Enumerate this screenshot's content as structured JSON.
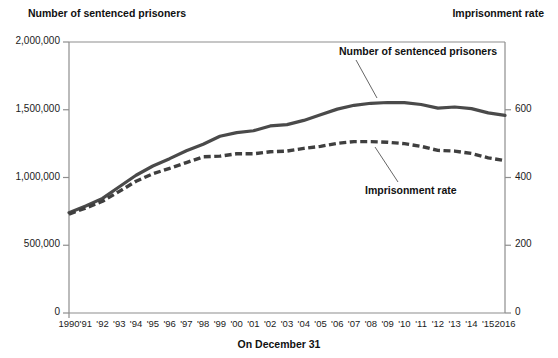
{
  "header": {
    "left_axis_title": "Number of sentenced prisoners",
    "right_axis_title": "Imprisonment rate"
  },
  "annotations": {
    "prisoners": "Number of sentenced prisoners",
    "rate": "Imprisonment rate"
  },
  "axis": {
    "xlabel": "On December 31",
    "y_left_ticks": [
      "0",
      "500,000",
      "1,000,000",
      "1,500,000",
      "2,000,000"
    ],
    "y_right_ticks": [
      "0",
      "200",
      "400",
      "600"
    ],
    "x_ticks": [
      "1990",
      "'91",
      "'92",
      "'93",
      "'94",
      "'95",
      "'96",
      "'97",
      "'98",
      "'99",
      "'00",
      "'01",
      "'02",
      "'03",
      "'04",
      "'05",
      "'06",
      "'07",
      "'08",
      "'09",
      "'10",
      "'11",
      "'12",
      "'13",
      "'14",
      "'15",
      "2016"
    ]
  },
  "colors": {
    "line": "#4a4a4a",
    "frame": "#8e8e8e",
    "text": "#1b1b1b"
  },
  "chart_data": {
    "type": "line",
    "title": "",
    "xlabel": "On December 31",
    "ylabel": "Number of sentenced prisoners",
    "y2label": "Imprisonment rate",
    "grid": false,
    "legend": "annotations-inline",
    "ylim": [
      0,
      2000000
    ],
    "y2lim": [
      0,
      800
    ],
    "x": [
      "1990",
      "1991",
      "1992",
      "1993",
      "1994",
      "1995",
      "1996",
      "1997",
      "1998",
      "1999",
      "2000",
      "2001",
      "2002",
      "2003",
      "2004",
      "2005",
      "2006",
      "2007",
      "2008",
      "2009",
      "2010",
      "2011",
      "2012",
      "2013",
      "2014",
      "2015",
      "2016"
    ],
    "series": [
      {
        "name": "Number of sentenced prisoners",
        "axis": "left",
        "style": "solid",
        "values": [
          739980,
          789610,
          846277,
          932074,
          1016691,
          1085022,
          1138984,
          1197590,
          1245402,
          1304074,
          1331278,
          1345217,
          1380516,
          1390279,
          1421345,
          1462866,
          1504598,
          1532851,
          1547742,
          1553574,
          1552669,
          1538847,
          1512430,
          1520403,
          1508636,
          1476847,
          1458173
        ]
      },
      {
        "name": "Imprisonment rate",
        "axis": "right",
        "style": "dashed",
        "values": [
          292,
          310,
          330,
          359,
          389,
          411,
          427,
          444,
          461,
          463,
          470,
          470,
          476,
          478,
          486,
          492,
          501,
          506,
          506,
          504,
          500,
          492,
          480,
          478,
          471,
          458,
          450
        ]
      }
    ]
  }
}
